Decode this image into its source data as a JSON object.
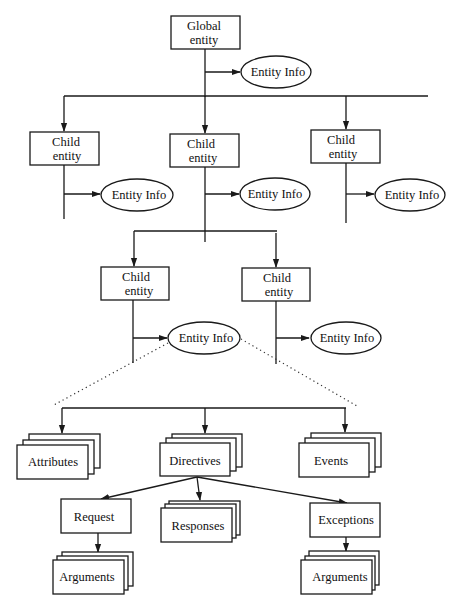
{
  "diagram": {
    "type": "entity hierarchy",
    "global": {
      "line1": "Global",
      "line2": "entity"
    },
    "entity_info_label": "Entity Info",
    "children_level1": [
      {
        "line1": "Child",
        "line2": "entity",
        "info": "Entity Info"
      },
      {
        "line1": "Child",
        "line2": "entity",
        "info": "Entity Info"
      },
      {
        "line1": "Child",
        "line2": "entity",
        "info": "Entity Info"
      }
    ],
    "children_level2": [
      {
        "line1": "Child",
        "line2": "entity",
        "info": "Entity Info"
      },
      {
        "line1": "Child",
        "line2": "entity",
        "info": "Entity Info"
      }
    ],
    "entity_info_components": {
      "attributes": "Attributes",
      "directives": "Directives",
      "events": "Events"
    },
    "directive_components": {
      "request": "Request",
      "responses": "Responses",
      "exceptions": "Exceptions"
    },
    "request_arguments": "Arguments",
    "exception_arguments": "Arguments"
  }
}
